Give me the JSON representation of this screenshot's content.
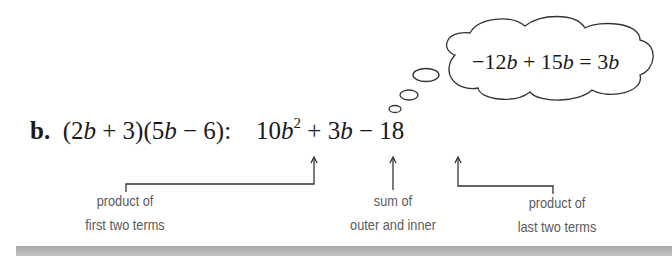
{
  "problem": {
    "label": "b.",
    "factored_expression": "(2b + 3)(5b − 6):",
    "result_terms": {
      "first_coef": "10",
      "first_var": "b",
      "first_exp": "2",
      "op1": "+",
      "middle_coef": "3",
      "middle_var": "b",
      "op2": "−",
      "last": "18"
    }
  },
  "thought_bubble": {
    "text": "−12b + 15b = 3b"
  },
  "annotations": [
    {
      "line1": "product of",
      "line2": "first two terms"
    },
    {
      "line1": "sum of",
      "line2": "outer and inner"
    },
    {
      "line1": "product of",
      "line2": "last two terms"
    }
  ],
  "colors": {
    "text": "#1a1a1a",
    "caption": "#5a5a5a",
    "lines": "#333333",
    "bottom_bar": "#b5b5b5"
  }
}
